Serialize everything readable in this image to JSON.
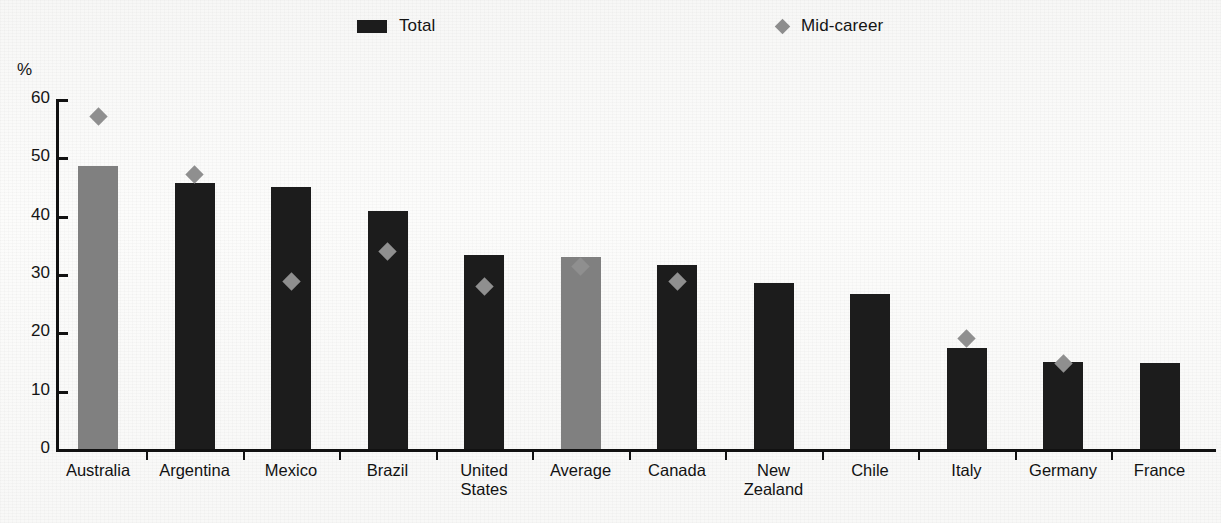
{
  "legend": {
    "total_label": "Total",
    "mid_career_label": "Mid-career"
  },
  "axis": {
    "unit": "%",
    "tick_labels": [
      "60",
      "50",
      "40",
      "30",
      "20",
      "10",
      "0"
    ]
  },
  "chart_data": {
    "type": "bar",
    "title": "",
    "subtitle": "",
    "xlabel": "",
    "ylabel": "%",
    "ylim": [
      0,
      60
    ],
    "yticks": [
      0,
      10,
      20,
      30,
      40,
      50,
      60
    ],
    "grid": false,
    "legend_position": "top",
    "categories": [
      "Australia",
      "Argentina",
      "Mexico",
      "Brazil",
      "United\nStates",
      "Average",
      "Canada",
      "New Zealand",
      "Chile",
      "Italy",
      "Germany",
      "France"
    ],
    "series": [
      {
        "name": "Total",
        "type": "bar",
        "values": [
          48.6,
          45.6,
          45.0,
          40.8,
          33.2,
          32.9,
          31.5,
          28.5,
          26.6,
          17.4,
          14.9,
          14.8
        ],
        "colors": [
          "#808080",
          "#1c1c1c",
          "#1c1c1c",
          "#1c1c1c",
          "#1c1c1c",
          "#808080",
          "#1c1c1c",
          "#1c1c1c",
          "#1c1c1c",
          "#1c1c1c",
          "#1c1c1c",
          "#1c1c1c"
        ]
      },
      {
        "name": "Mid-career",
        "type": "scatter",
        "marker": "diamond",
        "color": "#8f8f8f",
        "values": [
          57.0,
          47.1,
          28.8,
          33.8,
          27.8,
          31.3,
          28.8,
          null,
          null,
          19.0,
          14.6,
          null
        ]
      }
    ],
    "colors": {
      "bar_default": "#1c1c1c",
      "bar_highlight": "#808080",
      "marker": "#8f8f8f",
      "axis": "#111111",
      "background": "#fbfbfa"
    }
  }
}
